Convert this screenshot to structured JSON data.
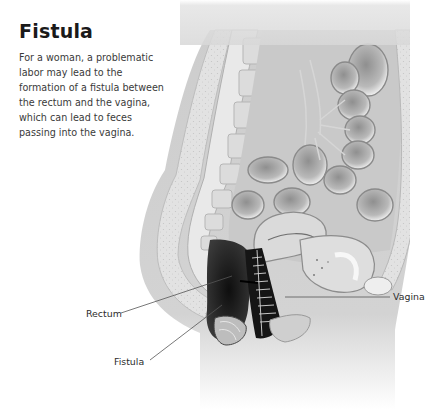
{
  "page": {
    "title": "Fistula",
    "body_lines": [
      "For a woman, a problematic",
      "labor may lead to the",
      "formation of a fistula between",
      "the rectum and the vagina,",
      "which can lead to feces",
      "passing into the vagina."
    ]
  },
  "figure": {
    "labels": {
      "rectum": "Rectum",
      "fistula": "Fistula",
      "vagina": "Vagina"
    },
    "colors": {
      "body_fill": "#cfcfcf",
      "tissue_light": "#e6e6e6",
      "dark_tissue": "#1e1e1e",
      "leader_line": "#555555"
    }
  }
}
